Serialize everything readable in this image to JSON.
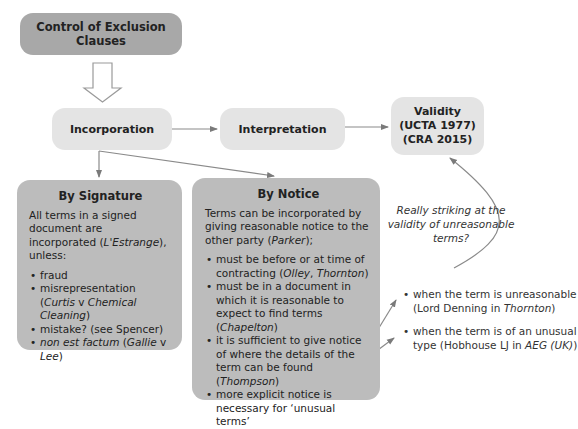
{
  "diagram": {
    "title_node": "Control of Exclusion Clauses",
    "nodes": {
      "incorporation": "Incorporation",
      "interpretation": "Interpretation",
      "validity": {
        "line1": "Validity",
        "line2": "(UCTA 1977)",
        "line3": "(CRA 2015)"
      }
    },
    "by_signature": {
      "title": "By Signature",
      "intro_prefix": "All terms in a signed document are incorporated (",
      "intro_case": "L'Estrange",
      "intro_suffix": "), unless:",
      "bullets": [
        {
          "text": "fraud"
        },
        {
          "pre": "misrepresentation (",
          "case": "Curtis",
          "mid": " v ",
          "case2": "Chemical Cleaning",
          "post": ")"
        },
        {
          "text": "mistake? (see Spencer)"
        },
        {
          "case": "non est factum",
          "pre2": " (",
          "case2": "Gallie",
          "mid": " v ",
          "case3": "Lee",
          "post": ")"
        }
      ]
    },
    "by_notice": {
      "title": "By Notice",
      "intro_prefix": "Terms can be incorporated by giving reasonable notice to the other party (",
      "intro_case": "Parker",
      "intro_suffix": ");",
      "bullets": [
        {
          "pre": "must be before or at time of contracting (",
          "case": "Olley",
          "mid": ", ",
          "case2": "Thornton",
          "post": ")"
        },
        {
          "pre": "must be in a document in which it is reasonable to expect to find terms (",
          "case": "Chapelton",
          "post": ")"
        },
        {
          "pre": "it is sufficient to give notice of where the details of the term can be found (",
          "case": "Thompson",
          "post": ")"
        },
        {
          "text": "more explicit notice is necessary for ‘unusual terms’"
        }
      ]
    },
    "annotation": "Really striking at the validity of unreasonable terms?",
    "unusual_terms": [
      {
        "pre": "when the term is unreasonable (Lord Denning in ",
        "case": "Thornton",
        "post": ")"
      },
      {
        "pre": "when the term is of an unusual type (Hobhouse LJ in ",
        "case": "AEG (UK)",
        "post": ")"
      }
    ]
  }
}
